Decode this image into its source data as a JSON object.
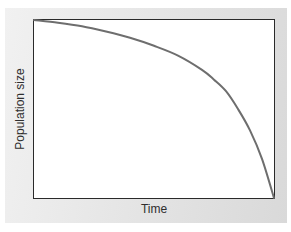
{
  "chart_data": {
    "type": "line",
    "title": "",
    "xlabel": "Time",
    "ylabel": "Population size",
    "x_ticks": [],
    "y_ticks": [],
    "grid": false,
    "legend": null,
    "xlim": [
      0,
      1
    ],
    "ylim": [
      0,
      1
    ],
    "series": [
      {
        "name": "population",
        "color": "#6e6e6e",
        "x": [
          0.0,
          0.1,
          0.2,
          0.3,
          0.4,
          0.5,
          0.6,
          0.7,
          0.75,
          0.8,
          0.85,
          0.9,
          0.95,
          1.0
        ],
        "y": [
          1.0,
          0.985,
          0.965,
          0.935,
          0.9,
          0.855,
          0.8,
          0.72,
          0.665,
          0.6,
          0.5,
          0.38,
          0.22,
          0.0
        ]
      }
    ]
  },
  "colors": {
    "panel": "#e3e3e3",
    "frame": "#2a2a2a",
    "curve": "#6e6e6e",
    "text": "#2e2e2e"
  }
}
